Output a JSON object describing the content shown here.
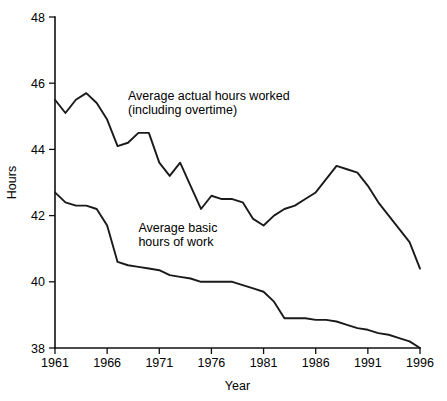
{
  "chart_data": {
    "type": "line",
    "title": "",
    "xlabel": "Year",
    "ylabel": "Hours",
    "xlim": [
      1961,
      1996
    ],
    "ylim": [
      38,
      48
    ],
    "grid": false,
    "legend_position": "inline-annotations",
    "x_ticks": [
      "1961",
      "1966",
      "1971",
      "1976",
      "1981",
      "1986",
      "1991",
      "1996"
    ],
    "x_tick_values": [
      1961,
      1966,
      1971,
      1976,
      1981,
      1986,
      1991,
      1996
    ],
    "y_ticks": [
      "38",
      "40",
      "42",
      "44",
      "46",
      "48"
    ],
    "y_tick_values": [
      38,
      40,
      42,
      44,
      46,
      48
    ],
    "x": [
      1961,
      1962,
      1963,
      1964,
      1965,
      1966,
      1967,
      1968,
      1969,
      1970,
      1971,
      1972,
      1973,
      1974,
      1975,
      1976,
      1977,
      1978,
      1979,
      1980,
      1981,
      1982,
      1983,
      1984,
      1985,
      1986,
      1987,
      1988,
      1989,
      1990,
      1991,
      1992,
      1993,
      1994,
      1995,
      1996
    ],
    "series": [
      {
        "name": "Average actual hours worked (including overtime)",
        "annotation_line1": "Average actual hours worked",
        "annotation_line2": "(including overtime)",
        "annotation_x": 1968.0,
        "annotation_y": 45.5,
        "color": "#1a1a1a",
        "values": [
          45.5,
          45.1,
          45.5,
          45.7,
          45.4,
          44.9,
          44.1,
          44.2,
          44.5,
          44.5,
          43.6,
          43.2,
          43.6,
          42.9,
          42.2,
          42.6,
          42.5,
          42.5,
          42.4,
          41.9,
          41.7,
          42.0,
          42.2,
          42.3,
          42.5,
          42.7,
          43.1,
          43.5,
          43.4,
          43.3,
          42.9,
          42.4,
          42.0,
          41.6,
          41.2,
          40.4
        ]
      },
      {
        "name": "Average basic hours of work",
        "annotation_line1": "Average basic",
        "annotation_line2": "hours of work",
        "annotation_x": 1969.0,
        "annotation_y": 41.5,
        "color": "#1a1a1a",
        "values": [
          42.7,
          42.4,
          42.3,
          42.3,
          42.2,
          41.7,
          40.6,
          40.5,
          40.45,
          40.4,
          40.35,
          40.2,
          40.15,
          40.1,
          40.0,
          40.0,
          40.0,
          40.0,
          39.9,
          39.8,
          39.7,
          39.4,
          38.9,
          38.9,
          38.9,
          38.85,
          38.85,
          38.8,
          38.7,
          38.6,
          38.55,
          38.45,
          38.4,
          38.3,
          38.2,
          38.0
        ]
      }
    ]
  }
}
